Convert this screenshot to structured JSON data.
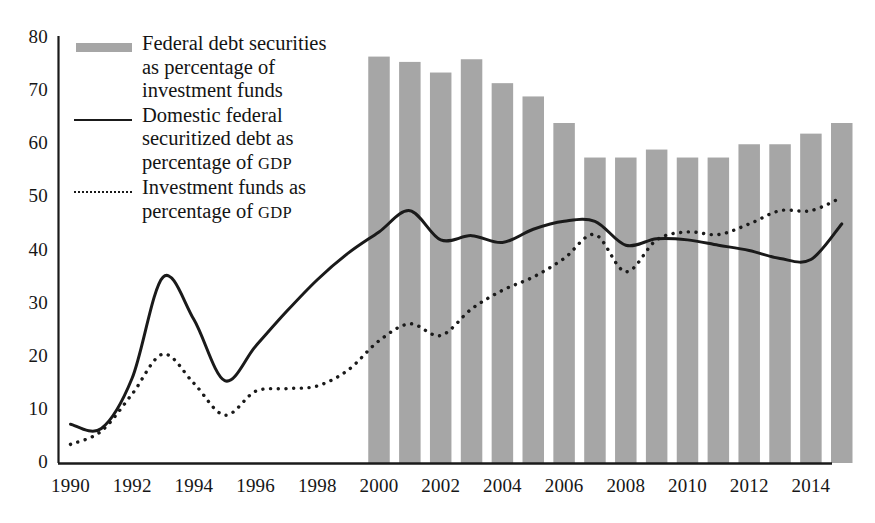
{
  "chart_data": {
    "type": "bar",
    "title": "",
    "xlabel": "",
    "ylabel": "",
    "ylim": [
      0,
      80
    ],
    "ytick_values": [
      0,
      10,
      20,
      30,
      40,
      50,
      60,
      70,
      80
    ],
    "xlim": [
      1990,
      2015
    ],
    "xtick_labels": [
      "1990",
      "1992",
      "1994",
      "1996",
      "1998",
      "2000",
      "2002",
      "2004",
      "2006",
      "2008",
      "2010",
      "2012",
      "2014"
    ],
    "xtick_values": [
      1990,
      1992,
      1994,
      1996,
      1998,
      2000,
      2002,
      2004,
      2006,
      2008,
      2010,
      2012,
      2014
    ],
    "grid": false,
    "legend_position": "upper-left-inside",
    "bar_color": "#a6a6a6",
    "line_color": "#1a1a1a",
    "series": [
      {
        "name": "Federal debt securities as percentage of investment funds",
        "render": "bar",
        "color": "#a6a6a6",
        "x": [
          2000,
          2001,
          2002,
          2003,
          2004,
          2005,
          2006,
          2007,
          2008,
          2009,
          2010,
          2011,
          2012,
          2013,
          2014,
          2015
        ],
        "values": [
          76.5,
          75.5,
          73.5,
          76.0,
          71.5,
          69.0,
          64.0,
          57.5,
          57.5,
          59.0,
          57.5,
          57.5,
          60.0,
          60.0,
          62.0,
          64.0
        ]
      },
      {
        "name": "Domestic federal securitized debt as percentage of GDP",
        "render": "line-solid",
        "color": "#1a1a1a",
        "x": [
          1990,
          1991,
          1992,
          1993,
          1994,
          1995,
          1996,
          1997,
          1998,
          1999,
          2000,
          2001,
          2002,
          2003,
          2004,
          2005,
          2006,
          2007,
          2008,
          2009,
          2010,
          2011,
          2012,
          2013,
          2014,
          2015
        ],
        "values": [
          7.3,
          6.5,
          16.0,
          35.0,
          27.0,
          15.5,
          22.0,
          28.5,
          34.5,
          39.5,
          43.5,
          47.5,
          42.0,
          42.8,
          41.5,
          44.0,
          45.5,
          45.5,
          41.0,
          42.2,
          42.0,
          41.0,
          40.0,
          38.5,
          38.3,
          45.0
        ]
      },
      {
        "name": "Investment funds as percentage of GDP",
        "render": "line-dotted",
        "color": "#1a1a1a",
        "x": [
          1990,
          1991,
          1992,
          1993,
          1994,
          1995,
          1996,
          1997,
          1998,
          1999,
          2000,
          2001,
          2002,
          2003,
          2004,
          2005,
          2006,
          2007,
          2008,
          2009,
          2010,
          2011,
          2012,
          2013,
          2014,
          2015
        ],
        "values": [
          3.5,
          6.0,
          13.0,
          20.5,
          15.0,
          9.0,
          13.5,
          14.0,
          14.5,
          17.5,
          23.0,
          26.2,
          24.0,
          29.0,
          32.5,
          35.0,
          38.5,
          43.0,
          36.0,
          42.0,
          43.5,
          43.0,
          45.0,
          47.5,
          47.5,
          50.0
        ]
      }
    ]
  },
  "legend": {
    "entries": [
      {
        "key": "bar-swatch",
        "line1": "Federal debt securities",
        "line2": "as percentage of",
        "line3": "investment funds",
        "smallcaps": ""
      },
      {
        "key": "solid-line",
        "line1": "Domestic federal",
        "line2": "securitized debt as",
        "line3": "percentage of ",
        "smallcaps": "GDP"
      },
      {
        "key": "dotted-line",
        "line1": "Investment funds as",
        "line2": "percentage of ",
        "line3": "",
        "smallcaps": "GDP"
      }
    ]
  },
  "axes": {
    "y_labels": [
      "80",
      "70",
      "60",
      "50",
      "40",
      "30",
      "20",
      "10",
      "0"
    ],
    "x_labels": [
      "1990",
      "1992",
      "1994",
      "1996",
      "1998",
      "2000",
      "2002",
      "2004",
      "2006",
      "2008",
      "2010",
      "2012",
      "2014"
    ]
  }
}
